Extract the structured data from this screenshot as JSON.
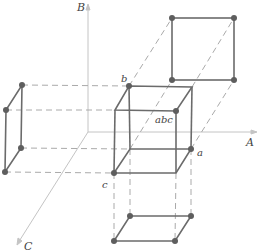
{
  "diagram": {
    "colors": {
      "edge": "#6b6b6b",
      "vertex": "#5a5a5a",
      "axis": "#bdbdbd",
      "dash": "#a8a8a8"
    },
    "axes": [
      {
        "name": "A",
        "label": "A"
      },
      {
        "name": "B",
        "label": "B"
      },
      {
        "name": "C",
        "label": "C"
      }
    ],
    "vertex_labels": {
      "a": "a",
      "b": "b",
      "c": "c",
      "abc": "abc"
    },
    "shapes": [
      "central-cube",
      "top-projection-square",
      "left-projection-square",
      "bottom-projection-square"
    ]
  }
}
